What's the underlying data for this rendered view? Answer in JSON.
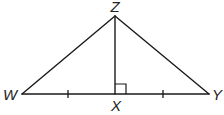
{
  "diagram": {
    "type": "geometry-triangle",
    "points": {
      "Z": {
        "label": "Z",
        "x": 115,
        "y": 16
      },
      "W": {
        "label": "W",
        "x": 22,
        "y": 94
      },
      "X": {
        "label": "X",
        "x": 115,
        "y": 94
      },
      "Y": {
        "label": "Y",
        "x": 209,
        "y": 94
      }
    },
    "segments": [
      {
        "from": "W",
        "to": "Z"
      },
      {
        "from": "Z",
        "to": "Y"
      },
      {
        "from": "W",
        "to": "Y"
      },
      {
        "from": "Z",
        "to": "X"
      }
    ],
    "markings": {
      "right_angle_at": "X",
      "congruent_ticks": [
        "WX",
        "XY"
      ]
    },
    "colors": {
      "stroke": "#1a1a1a",
      "label": "#222222",
      "background": "#ffffff"
    }
  }
}
